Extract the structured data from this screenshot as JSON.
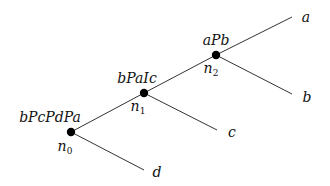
{
  "diagram": {
    "type": "tree",
    "nodes": [
      {
        "id": "n0",
        "name": "n",
        "index": "0",
        "preference": "bPcPdPa"
      },
      {
        "id": "n1",
        "name": "n",
        "index": "1",
        "preference": "bPaIc"
      },
      {
        "id": "n2",
        "name": "n",
        "index": "2",
        "preference": "aPb"
      }
    ],
    "leaves": [
      {
        "id": "a",
        "label": "a",
        "parent": "n2"
      },
      {
        "id": "b",
        "label": "b",
        "parent": "n2"
      },
      {
        "id": "c",
        "label": "c",
        "parent": "n1"
      },
      {
        "id": "d",
        "label": "d",
        "parent": "n0"
      }
    ],
    "edges": [
      [
        "n0",
        "n1"
      ],
      [
        "n1",
        "n2"
      ],
      [
        "n2",
        "a"
      ],
      [
        "n2",
        "b"
      ],
      [
        "n1",
        "c"
      ],
      [
        "n0",
        "d"
      ]
    ]
  }
}
